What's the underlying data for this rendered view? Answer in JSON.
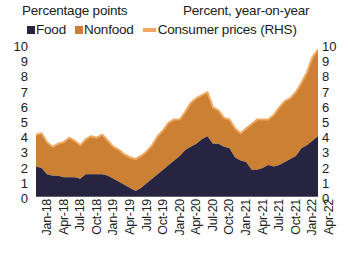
{
  "header": {
    "left_title": "Percentage points",
    "right_title": "Percent, year-on-year"
  },
  "legend": {
    "items": [
      {
        "label": "Food",
        "marker": "square-swatch",
        "color": "#262440"
      },
      {
        "label": "Nonfood",
        "marker": "square-swatch",
        "color": "#CC8033"
      },
      {
        "label": "Consumer prices (RHS)",
        "marker": "line-swatch",
        "color": "#F0A860"
      }
    ]
  },
  "axes": {
    "left_ticks": [
      "10",
      "9",
      "8",
      "7",
      "6",
      "5",
      "4",
      "3",
      "2",
      "1",
      "0"
    ],
    "right_ticks": [
      "10",
      "9",
      "8",
      "7",
      "6",
      "5",
      "4",
      "3",
      "2",
      "1",
      "0"
    ],
    "ylim": [
      0,
      10
    ]
  },
  "chart_data": {
    "type": "area",
    "title": "",
    "subtitle": "",
    "xlabel": "",
    "ylabel": "Percentage points",
    "y2label": "Percent, year-on-year",
    "ylim": [
      0,
      10
    ],
    "y2lim": [
      0,
      10
    ],
    "grid": false,
    "legend_position": "top",
    "stacked": true,
    "tick_labels": [
      "Jan-18",
      "Apr-18",
      "Jul-18",
      "Oct-18",
      "Jan-19",
      "Apr-19",
      "Jul-19",
      "Oct-19",
      "Jan-20",
      "Apr-20",
      "Jul-20",
      "Oct-20",
      "Jan-21",
      "Apr-21",
      "Jul-21",
      "Oct-21",
      "Jan-22",
      "Apr-22"
    ],
    "x": [
      "Jan-18",
      "Feb-18",
      "Mar-18",
      "Apr-18",
      "May-18",
      "Jun-18",
      "Jul-18",
      "Aug-18",
      "Sep-18",
      "Oct-18",
      "Nov-18",
      "Dec-18",
      "Jan-19",
      "Feb-19",
      "Mar-19",
      "Apr-19",
      "May-19",
      "Jun-19",
      "Jul-19",
      "Aug-19",
      "Sep-19",
      "Oct-19",
      "Nov-19",
      "Dec-19",
      "Jan-20",
      "Feb-20",
      "Mar-20",
      "Apr-20",
      "May-20",
      "Jun-20",
      "Jul-20",
      "Aug-20",
      "Sep-20",
      "Oct-20",
      "Nov-20",
      "Dec-20",
      "Jan-21",
      "Feb-21",
      "Mar-21",
      "Apr-21",
      "May-21",
      "Jun-21",
      "Jul-21",
      "Aug-21",
      "Sep-21",
      "Oct-21",
      "Nov-21",
      "Dec-21",
      "Jan-22",
      "Feb-22",
      "Mar-22",
      "Apr-22"
    ],
    "series": [
      {
        "name": "Food",
        "color": "#262440",
        "values": [
          2.0,
          1.9,
          1.5,
          1.4,
          1.4,
          1.3,
          1.3,
          1.3,
          1.2,
          1.5,
          1.5,
          1.5,
          1.5,
          1.4,
          1.2,
          1.0,
          0.8,
          0.6,
          0.4,
          0.6,
          0.9,
          1.2,
          1.5,
          1.8,
          2.1,
          2.4,
          2.7,
          3.1,
          3.3,
          3.5,
          3.8,
          4.0,
          3.5,
          3.5,
          3.3,
          3.2,
          2.6,
          2.4,
          2.3,
          1.8,
          1.8,
          1.9,
          2.1,
          2.0,
          2.1,
          2.3,
          2.5,
          2.7,
          3.2,
          3.4,
          3.7,
          4.0
        ]
      },
      {
        "name": "Nonfood",
        "color": "#CC8033",
        "values": [
          2.1,
          2.3,
          2.1,
          1.9,
          2.1,
          2.3,
          2.6,
          2.4,
          2.2,
          2.3,
          2.5,
          2.4,
          2.6,
          2.3,
          2.1,
          2.1,
          2.0,
          2.0,
          2.1,
          2.1,
          2.1,
          2.2,
          2.5,
          2.6,
          2.8,
          2.7,
          2.4,
          2.5,
          2.9,
          3.0,
          2.9,
          2.9,
          2.4,
          2.2,
          1.9,
          1.9,
          1.9,
          1.8,
          2.2,
          3.0,
          3.3,
          3.2,
          3.0,
          3.4,
          3.8,
          4.0,
          4.0,
          4.2,
          4.3,
          4.8,
          5.5,
          5.7
        ]
      }
    ],
    "line_series": {
      "name": "Consumer prices (RHS)",
      "color": "#F0A860",
      "axis": "right",
      "values": [
        4.1,
        4.2,
        3.6,
        3.3,
        3.5,
        3.6,
        3.9,
        3.7,
        3.4,
        3.8,
        4.0,
        3.9,
        4.1,
        3.7,
        3.3,
        3.1,
        2.8,
        2.6,
        2.5,
        2.7,
        3.0,
        3.4,
        4.0,
        4.4,
        4.9,
        5.1,
        5.1,
        5.6,
        6.2,
        6.5,
        6.7,
        6.9,
        5.9,
        5.7,
        5.2,
        5.1,
        4.5,
        4.2,
        4.5,
        4.8,
        5.1,
        5.1,
        5.1,
        5.4,
        5.9,
        6.3,
        6.5,
        6.9,
        7.5,
        8.2,
        9.2,
        9.7
      ]
    }
  }
}
